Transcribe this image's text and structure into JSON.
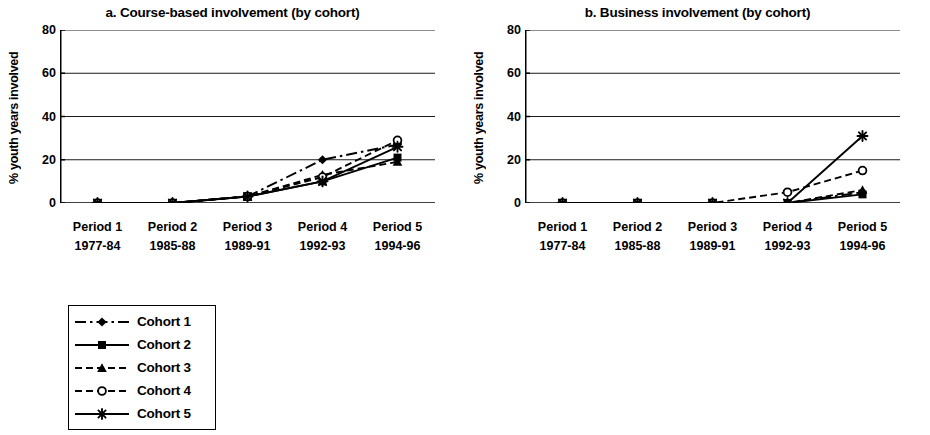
{
  "figure": {
    "ylabel": "% youth years involved",
    "yticks": [
      0,
      20,
      40,
      60,
      80
    ],
    "xlabels": [
      {
        "line1": "Period 1",
        "line2": "1977-84"
      },
      {
        "line1": "Period 2",
        "line2": "1985-88"
      },
      {
        "line1": "Period 3",
        "line2": "1989-91"
      },
      {
        "line1": "Period 4",
        "line2": "1992-93"
      },
      {
        "line1": "Period 5",
        "line2": "1994-96"
      }
    ]
  },
  "legend": {
    "items": [
      {
        "label": "Cohort 1",
        "marker": "diamond-marker",
        "linestyle": "dashdot",
        "color": "#000000"
      },
      {
        "label": "Cohort 2",
        "marker": "square-marker",
        "linestyle": "solid",
        "color": "#000000"
      },
      {
        "label": "Cohort 3",
        "marker": "triangle-marker",
        "linestyle": "dashed",
        "color": "#000000"
      },
      {
        "label": "Cohort 4",
        "marker": "open-circle-marker",
        "linestyle": "dashed",
        "color": "#000000"
      },
      {
        "label": "Cohort 5",
        "marker": "asterisk-marker",
        "linestyle": "solid",
        "color": "#000000"
      }
    ]
  },
  "chart_data": [
    {
      "type": "line",
      "panel": "a",
      "title": "a. Course-based involvement (by cohort)",
      "xlabel": "",
      "ylabel": "% youth years involved",
      "categories": [
        "Period 1 1977-84",
        "Period 2 1985-88",
        "Period 3 1989-91",
        "Period 4 1992-93",
        "Period 5 1994-96"
      ],
      "ylim": [
        0,
        80
      ],
      "yticks": [
        0,
        20,
        40,
        60,
        80
      ],
      "grid": "horizontal",
      "legend_position": "below-figure",
      "series": [
        {
          "name": "Cohort 1",
          "values": [
            0,
            0,
            3,
            20,
            27
          ]
        },
        {
          "name": "Cohort 2",
          "values": [
            0,
            0,
            3,
            10,
            21
          ]
        },
        {
          "name": "Cohort 3",
          "values": [
            0,
            0,
            3,
            13,
            19
          ]
        },
        {
          "name": "Cohort 4",
          "values": [
            0,
            0,
            3,
            12,
            29
          ]
        },
        {
          "name": "Cohort 5",
          "values": [
            0,
            0,
            3,
            10,
            26
          ]
        }
      ]
    },
    {
      "type": "line",
      "panel": "b",
      "title": "b. Business involvement (by cohort)",
      "xlabel": "",
      "ylabel": "% youth years involved",
      "categories": [
        "Period 1 1977-84",
        "Period 2 1985-88",
        "Period 3 1989-91",
        "Period 4 1992-93",
        "Period 5 1994-96"
      ],
      "ylim": [
        0,
        80
      ],
      "yticks": [
        0,
        20,
        40,
        60,
        80
      ],
      "grid": "horizontal",
      "legend_position": "below-figure",
      "series": [
        {
          "name": "Cohort 1",
          "values": [
            0,
            0,
            0,
            0,
            5
          ]
        },
        {
          "name": "Cohort 2",
          "values": [
            0,
            0,
            0,
            0,
            4
          ]
        },
        {
          "name": "Cohort 3",
          "values": [
            0,
            0,
            0,
            0,
            6
          ]
        },
        {
          "name": "Cohort 4",
          "values": [
            0,
            0,
            0,
            5,
            15
          ]
        },
        {
          "name": "Cohort 5",
          "values": [
            0,
            0,
            0,
            0,
            31
          ]
        }
      ]
    }
  ]
}
